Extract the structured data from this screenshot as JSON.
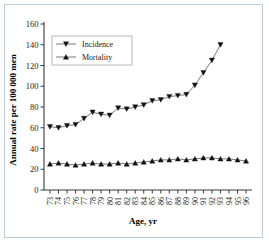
{
  "figure": {
    "border_color": "#b8cede",
    "background": "#ffffff"
  },
  "chart_data": {
    "type": "line",
    "title": "",
    "xlabel": "Age, yr",
    "ylabel": "Annual rate per 100 000 men",
    "xlim": [
      72.3,
      96.7
    ],
    "ylim": [
      0,
      160
    ],
    "yticks": [
      0,
      20,
      40,
      60,
      80,
      100,
      120,
      140,
      160
    ],
    "ytick_labels": [
      "0",
      "20",
      "40",
      "60",
      "80",
      "100",
      "120",
      "140",
      "160"
    ],
    "x": [
      73,
      74,
      75,
      76,
      77,
      78,
      79,
      80,
      81,
      82,
      83,
      84,
      85,
      86,
      87,
      88,
      89,
      90,
      91,
      92,
      93,
      94,
      95,
      96
    ],
    "xtick_labels": [
      "73",
      "74",
      "75",
      "76",
      "77",
      "78",
      "79",
      "80",
      "81",
      "82",
      "83",
      "84",
      "85",
      "86",
      "87",
      "88",
      "89",
      "90",
      "91",
      "92",
      "93",
      "94",
      "95",
      "96"
    ],
    "grid": false,
    "legend_position": "upper-left",
    "series": [
      {
        "name": "Incidence",
        "marker": "triangle-down",
        "color": "#111111",
        "x": [
          73,
          74,
          75,
          76,
          77,
          78,
          79,
          80,
          81,
          82,
          83,
          84,
          85,
          86,
          87,
          88,
          89,
          90,
          91,
          92,
          93
        ],
        "values": [
          61,
          60,
          62,
          63,
          69,
          75,
          73,
          72,
          79,
          78,
          80,
          82,
          86,
          87,
          90,
          91,
          92,
          101,
          113,
          125,
          140
        ]
      },
      {
        "name": "Mortality",
        "marker": "triangle-up",
        "color": "#111111",
        "x": [
          73,
          74,
          75,
          76,
          77,
          78,
          79,
          80,
          81,
          82,
          83,
          84,
          85,
          86,
          87,
          88,
          89,
          90,
          91,
          92,
          93,
          94,
          95,
          96
        ],
        "values": [
          25,
          26,
          25,
          24,
          25,
          26,
          25,
          25,
          26,
          25,
          26,
          27,
          28,
          29,
          29,
          30,
          29,
          30,
          31,
          31,
          30,
          30,
          29,
          28
        ]
      }
    ]
  },
  "legend": {
    "entries": [
      {
        "label": "Incidence"
      },
      {
        "label": "Mortality"
      }
    ]
  }
}
